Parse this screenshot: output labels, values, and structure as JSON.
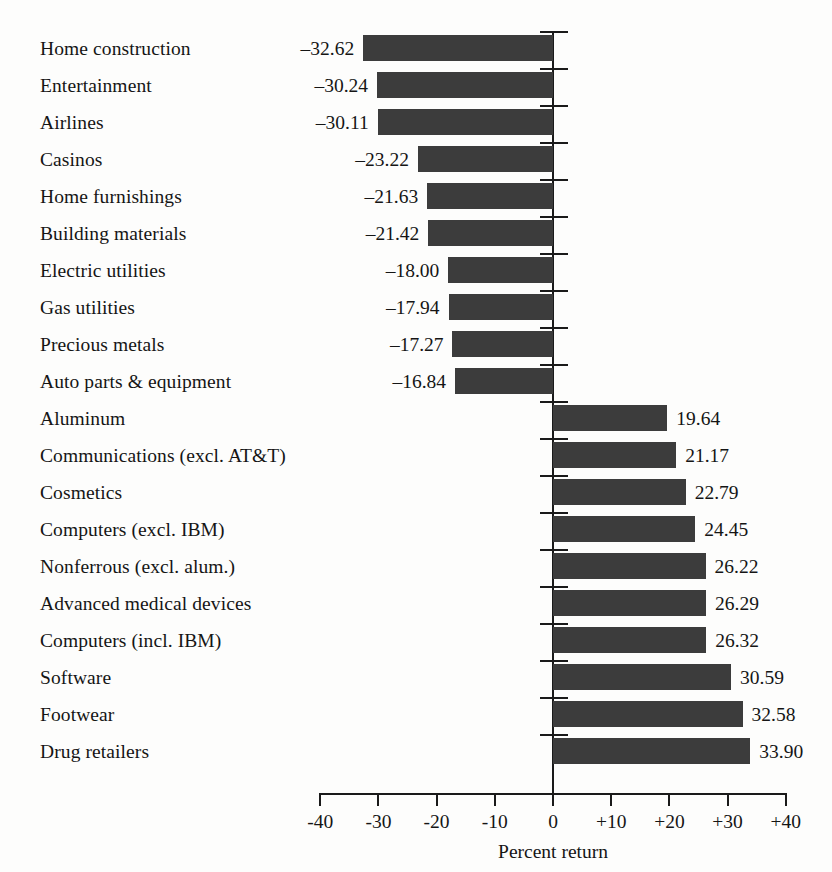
{
  "chart_data": {
    "type": "bar",
    "orientation": "horizontal",
    "title": "",
    "subtitle": "",
    "xlabel": "Percent return",
    "ylabel": "",
    "xlim": [
      -40,
      40
    ],
    "grid": false,
    "legend": null,
    "bar_color": "#3c3c3c",
    "tick_values": [
      -40,
      -30,
      -20,
      -10,
      0,
      10,
      20,
      30,
      40
    ],
    "tick_labels": [
      "-40",
      "-30",
      "-20",
      "-10",
      "0",
      "+10",
      "+20",
      "+30",
      "+40"
    ],
    "categories": [
      "Home construction",
      "Entertainment",
      "Airlines",
      "Casinos",
      "Home furnishings",
      "Building materials",
      "Electric utilities",
      "Gas utilities",
      "Precious metals",
      "Auto parts & equipment",
      "Aluminum",
      "Communications (excl. AT&T)",
      "Cosmetics",
      "Computers (excl. IBM)",
      "Nonferrous (excl. alum.)",
      "Advanced medical devices",
      "Computers (incl. IBM)",
      "Software",
      "Footwear",
      "Drug retailers"
    ],
    "values": [
      -32.62,
      -30.24,
      -30.11,
      -23.22,
      -21.63,
      -21.42,
      -18.0,
      -17.94,
      -17.27,
      -16.84,
      19.64,
      21.17,
      22.79,
      24.45,
      26.22,
      26.29,
      26.32,
      30.59,
      32.58,
      33.9
    ],
    "value_labels": [
      "–32.62",
      "–30.24",
      "–30.11",
      "–23.22",
      "–21.63",
      "–21.42",
      "–18.00",
      "–17.94",
      "–17.27",
      "–16.84",
      "19.64",
      "21.17",
      "22.79",
      "24.45",
      "26.22",
      "26.29",
      "26.32",
      "30.59",
      "32.58",
      "33.90"
    ]
  }
}
